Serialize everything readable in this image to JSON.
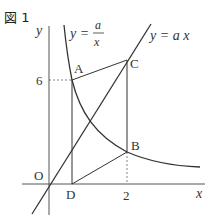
{
  "figure": {
    "label": "図 1"
  },
  "axes": {
    "x_label": "x",
    "y_label": "y",
    "origin_label": "O",
    "x_tick": "2",
    "y_tick": "6"
  },
  "curves": {
    "hyperbola_label_lhs": "y =",
    "hyperbola_numerator": "a",
    "hyperbola_denominator": "x",
    "line_label": "y = a x"
  },
  "points": {
    "A": "A",
    "B": "B",
    "C": "C",
    "D": "D"
  },
  "colors": {
    "stroke": "#333333",
    "dashed": "#666666"
  }
}
